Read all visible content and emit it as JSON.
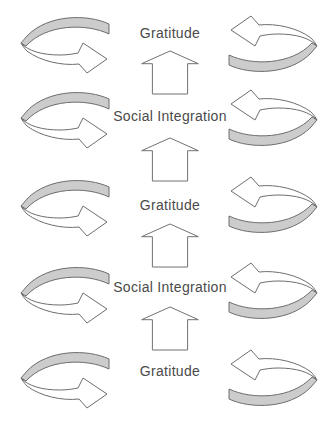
{
  "diagram": {
    "labels": [
      "Gratitude",
      "Social Integration",
      "Gratitude",
      "Social Integration",
      "Gratitude"
    ],
    "icons": {
      "left_side": "cyclic-rotation-arrow",
      "right_side": "cyclic-rotation-arrow-reversed",
      "center": "block-arrow-up"
    },
    "colors": {
      "background": "#ffffff",
      "band_fill": "#cccccc",
      "shape_fill": "#ffffff",
      "outline": "#6e6e6e",
      "text": "#4a4a4a"
    }
  }
}
